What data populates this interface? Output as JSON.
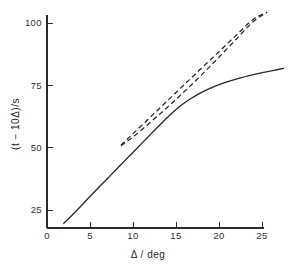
{
  "figure": {
    "background_color": "#ffffff",
    "ink_color": "#2a2a2a",
    "width": 297,
    "height": 268
  },
  "chart_data": {
    "type": "line",
    "title": "",
    "subtitle": "",
    "xlabel": "Δ / deg",
    "ylabel": "(t − 10Δ)/s",
    "ylabel_parts": {
      "open_paren": "(",
      "variable": "t",
      "minus": "−",
      "term": "10Δ",
      "close_paren": ")",
      "unit": "/s"
    },
    "xlabel_parts": {
      "variable": "Δ",
      "separator": "/",
      "unit": "deg"
    },
    "xlim": [
      0,
      27.6
    ],
    "ylim": [
      17.5,
      106
    ],
    "xticks": [
      0,
      5,
      10,
      15,
      20,
      25
    ],
    "xticklabels": [
      "0",
      "5",
      "10",
      "15",
      "20",
      "25"
    ],
    "yticks": [
      25,
      50,
      75,
      100
    ],
    "yticklabels": [
      "25",
      "50",
      "75",
      "100"
    ],
    "grid": false,
    "legend": null,
    "legend_position": "none",
    "spines": [
      "left",
      "bottom"
    ],
    "series": [
      {
        "name": "solid-curve",
        "style": "solid",
        "x": [
          1.95,
          3.0,
          4.5,
          6.0,
          7.5,
          9.0,
          10.5,
          12.0,
          13.0,
          14.0,
          15.0,
          15.8,
          16.6,
          17.5,
          18.5,
          19.5,
          20.5,
          21.5,
          22.5,
          23.5,
          24.5,
          25.5,
          26.5,
          27.5
        ],
        "y": [
          19.6,
          23.2,
          28.6,
          34.0,
          39.3,
          44.6,
          49.9,
          55.2,
          58.7,
          62.1,
          65.3,
          67.5,
          69.4,
          71.3,
          73.1,
          74.6,
          75.9,
          77.0,
          78.0,
          78.9,
          79.7,
          80.4,
          81.1,
          81.8
        ]
      },
      {
        "name": "dashed-upper",
        "style": "dashed",
        "x": [
          8.6,
          10.0,
          12.0,
          14.0,
          16.0,
          18.0,
          20.0,
          22.0,
          24.0,
          25.6
        ],
        "y": [
          51.0,
          55.6,
          62.2,
          68.8,
          75.4,
          82.0,
          88.5,
          95.1,
          101.5,
          104.3
        ]
      },
      {
        "name": "dashed-lower",
        "style": "dashed",
        "x": [
          8.6,
          10.0,
          12.0,
          14.0,
          16.0,
          18.0,
          20.0,
          22.0,
          24.0,
          25.6
        ],
        "y": [
          50.8,
          54.3,
          60.1,
          66.2,
          72.6,
          79.3,
          86.3,
          93.5,
          100.6,
          104.3
        ]
      }
    ]
  }
}
